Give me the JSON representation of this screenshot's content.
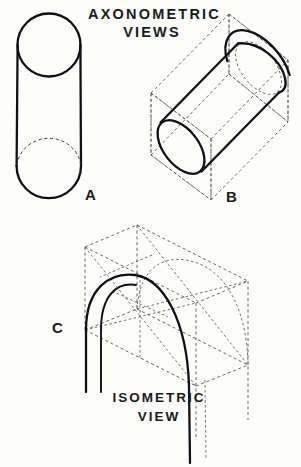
{
  "page": {
    "background_color": "#fdfdfb",
    "ink_color": "#111111",
    "construction_color": "#555555",
    "width": 301,
    "height": 467
  },
  "title": {
    "line1": "AXONOMETRIC",
    "line2": "VIEWS"
  },
  "caption": {
    "line1": "ISOMETRIC",
    "line2": "VIEW"
  },
  "figures": [
    {
      "id": "A",
      "label": "A",
      "name": "vertical-cylinder",
      "description": "Upright cylinder drawn as a true circle top view merging into a vertical cylinder with hidden bottom ellipse"
    },
    {
      "id": "B",
      "label": "B",
      "name": "oblique-cylinder-in-box",
      "description": "Cylinder drawn in axonometric projection inscribed in a dashed rectangular construction prism"
    },
    {
      "id": "C",
      "label": "C",
      "name": "isometric-arch",
      "description": "Semicircular arch shown in isometric view inside a dashed rectangular construction box"
    }
  ],
  "labels": {
    "a": "A",
    "b": "B",
    "c": "C"
  }
}
